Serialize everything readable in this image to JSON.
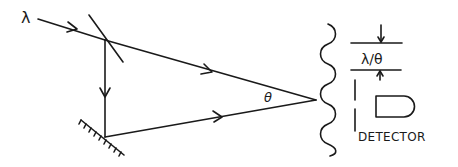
{
  "diagram": {
    "labels": {
      "wavelength": "λ",
      "angle": "θ",
      "fringe_spacing": "λ/θ",
      "detector": "DETECTOR"
    },
    "components": [
      {
        "name": "incoming-beam",
        "type": "ray"
      },
      {
        "name": "beam-splitter",
        "type": "optic"
      },
      {
        "name": "mirror",
        "type": "optic"
      },
      {
        "name": "upper-beam",
        "type": "ray"
      },
      {
        "name": "lower-beam",
        "type": "ray"
      },
      {
        "name": "interference-wavefront",
        "type": "wave"
      },
      {
        "name": "slit",
        "type": "aperture"
      },
      {
        "name": "detector",
        "type": "sensor"
      }
    ],
    "colors": {
      "ink": "#1a1a1a",
      "background": "#ffffff"
    }
  }
}
